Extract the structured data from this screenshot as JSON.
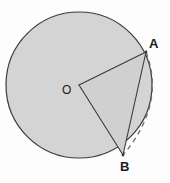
{
  "figure": {
    "background_color": "#fdfdfd",
    "labels": {
      "center": "O",
      "point_a": "A",
      "point_b": "B"
    },
    "colors": {
      "disk_fill": "#d4d4d4",
      "sector_fill": "#d0d0d0",
      "outline": "#3a3a3a",
      "dashed_arc": "#6b6b6b",
      "label_text": "#1a1a1a"
    },
    "geometry": {
      "circle": {
        "center_x": 79,
        "center_y": 85,
        "radius": 73
      },
      "point_a": {
        "x": 146,
        "y": 52
      },
      "point_b": {
        "x": 123,
        "y": 155
      },
      "dashed_arc": {
        "from": "A",
        "to": "B",
        "bulge_direction": "outward-right",
        "dash_pattern": "5,4"
      },
      "segments": [
        {
          "name": "radius-OA",
          "from": "O",
          "to": "A"
        },
        {
          "name": "radius-OB",
          "from": "O",
          "to": "B"
        },
        {
          "name": "chord-AB",
          "from": "A",
          "to": "B"
        }
      ]
    }
  }
}
